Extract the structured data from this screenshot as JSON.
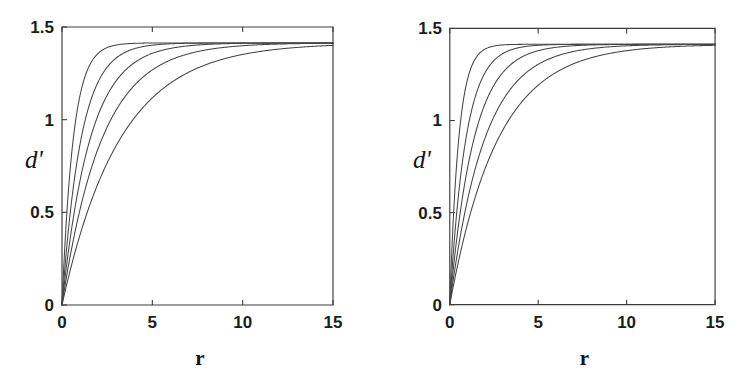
{
  "figure": {
    "background_color": "#ffffff",
    "ink_color": "#3c3c3c",
    "curve_color": "#454545",
    "panel_count": 2
  },
  "chart_data": [
    {
      "type": "line",
      "panel": "left",
      "title": "",
      "xlabel": "r",
      "ylabel": "d'",
      "xlim": [
        0,
        15
      ],
      "ylim": [
        0,
        1.5
      ],
      "xticks": [
        0,
        5,
        10,
        15
      ],
      "xticklabels": [
        "0",
        "5",
        "10",
        "15"
      ],
      "yticks": [
        0,
        0.5,
        1,
        1.5
      ],
      "yticklabels": [
        "0",
        "0.5",
        "1",
        "1.5"
      ],
      "grid": false,
      "legend": "none",
      "asymptote": 1.414,
      "series": [
        {
          "name": "curve-1",
          "tau": 0.62,
          "x": [
            0,
            0.15,
            0.3,
            0.5,
            0.75,
            1,
            1.25,
            1.5,
            1.75,
            2,
            2.5,
            3,
            3.5,
            4,
            5,
            6,
            7,
            8,
            9,
            10,
            11,
            12,
            13,
            14,
            15
          ],
          "y": [
            0,
            0.299,
            0.538,
            0.797,
            1.012,
            1.159,
            1.259,
            1.327,
            1.373,
            1.404,
            1.411,
            1.4135,
            1.4139,
            1.414,
            1.414,
            1.414,
            1.414,
            1.414,
            1.414,
            1.414,
            1.414,
            1.414,
            1.414,
            1.414,
            1.414
          ]
        },
        {
          "name": "curve-2",
          "tau": 1.05,
          "x": [
            0,
            0.25,
            0.5,
            0.75,
            1,
            1.5,
            2,
            2.5,
            3,
            3.5,
            4,
            4.5,
            5,
            6,
            7,
            8,
            9,
            10,
            11,
            12,
            13,
            14,
            15
          ],
          "y": [
            0,
            0.3,
            0.544,
            0.742,
            0.904,
            1.145,
            1.3,
            1.4,
            1.414,
            1.414,
            1.414,
            1.414,
            1.414,
            1.414,
            1.414,
            1.414,
            1.414,
            1.414,
            1.414,
            1.414,
            1.414,
            1.414,
            1.414
          ]
        },
        {
          "name": "curve-3",
          "tau": 1.55,
          "x": [
            0,
            0.25,
            0.5,
            1,
            1.5,
            2,
            2.5,
            3,
            3.5,
            4,
            4.5,
            5,
            5.5,
            6,
            7,
            8,
            9,
            10,
            11,
            12,
            13,
            14,
            15
          ],
          "y": [
            0,
            0.213,
            0.4,
            0.718,
            0.963,
            1.151,
            1.295,
            1.4,
            1.414,
            1.414,
            1.414,
            1.414,
            1.414,
            1.414,
            1.414,
            1.414,
            1.414,
            1.414,
            1.414,
            1.414,
            1.414,
            1.414,
            1.414
          ]
        },
        {
          "name": "curve-4",
          "tau": 2.2,
          "x": [
            0,
            0.5,
            1,
            1.5,
            2,
            2.5,
            3,
            3.5,
            4,
            4.5,
            5,
            5.5,
            6,
            6.5,
            7,
            8,
            9,
            10,
            11,
            12,
            13,
            14,
            15
          ],
          "y": [
            0,
            0.299,
            0.551,
            0.764,
            0.942,
            1.094,
            1.22,
            1.326,
            1.41,
            1.414,
            1.414,
            1.414,
            1.414,
            1.414,
            1.414,
            1.414,
            1.414,
            1.414,
            1.414,
            1.414,
            1.414,
            1.414,
            1.414
          ]
        },
        {
          "name": "curve-5",
          "tau": 3.2,
          "x": [
            0,
            0.5,
            1,
            1.5,
            2,
            2.5,
            3,
            3.5,
            4,
            5,
            6,
            7,
            8,
            9,
            10,
            11,
            12,
            13,
            14,
            15
          ],
          "y": [
            0,
            0.212,
            0.4,
            0.566,
            0.714,
            0.845,
            0.962,
            1.065,
            1.157,
            1.308,
            1.414,
            1.414,
            1.414,
            1.414,
            1.414,
            1.414,
            1.414,
            1.414,
            1.414,
            1.414
          ]
        }
      ]
    },
    {
      "type": "line",
      "panel": "right",
      "title": "",
      "xlabel": "r",
      "ylabel": "d'",
      "xlim": [
        0,
        15
      ],
      "ylim": [
        0,
        1.5
      ],
      "xticks": [
        0,
        5,
        10,
        15
      ],
      "xticklabels": [
        "0",
        "5",
        "10",
        "15"
      ],
      "yticks": [
        0,
        0.5,
        1,
        1.5
      ],
      "yticklabels": [
        "0",
        "0.5",
        "1",
        "1.5"
      ],
      "grid": false,
      "legend": "none",
      "asymptote": 1.414,
      "series": [
        {
          "name": "curve-1",
          "tau": 0.5,
          "x": [
            0,
            0.15,
            0.3,
            0.5,
            0.7,
            0.9,
            1.1,
            1.3,
            1.5,
            1.8,
            2,
            2.5,
            3,
            4,
            5,
            6,
            7,
            8,
            9,
            10,
            11,
            12,
            13,
            14,
            15
          ],
          "y": [
            0,
            0.361,
            0.638,
            0.924,
            1.106,
            1.228,
            1.311,
            1.365,
            1.4,
            1.412,
            1.414,
            1.414,
            1.414,
            1.414,
            1.414,
            1.414,
            1.414,
            1.414,
            1.414,
            1.414,
            1.414,
            1.414,
            1.414,
            1.414,
            1.414
          ]
        },
        {
          "name": "curve-2",
          "tau": 0.9,
          "x": [
            0,
            0.25,
            0.5,
            0.75,
            1,
            1.5,
            2,
            2.5,
            3,
            3.5,
            4,
            5,
            6,
            7,
            8,
            9,
            10,
            11,
            12,
            13,
            14,
            15
          ],
          "y": [
            0,
            0.343,
            0.607,
            0.81,
            0.966,
            1.177,
            1.3,
            1.4,
            1.414,
            1.414,
            1.414,
            1.414,
            1.414,
            1.414,
            1.414,
            1.414,
            1.414,
            1.414,
            1.414,
            1.414,
            1.414,
            1.414
          ]
        },
        {
          "name": "curve-3",
          "tau": 1.35,
          "x": [
            0,
            0.25,
            0.5,
            1,
            1.5,
            2,
            2.5,
            3,
            3.5,
            4,
            4.5,
            5,
            6,
            7,
            8,
            9,
            10,
            11,
            12,
            13,
            14,
            15
          ],
          "y": [
            0,
            0.24,
            0.447,
            0.79,
            1.043,
            1.228,
            1.364,
            1.41,
            1.414,
            1.414,
            1.414,
            1.414,
            1.414,
            1.414,
            1.414,
            1.414,
            1.414,
            1.414,
            1.414,
            1.414,
            1.414,
            1.414
          ]
        },
        {
          "name": "curve-4",
          "tau": 1.95,
          "x": [
            0,
            0.5,
            1,
            1.5,
            2,
            2.5,
            3,
            3.5,
            4,
            4.5,
            5,
            5.5,
            6,
            7,
            8,
            9,
            10,
            11,
            12,
            13,
            14,
            15
          ],
          "y": [
            0,
            0.331,
            0.604,
            0.826,
            1.008,
            1.157,
            1.278,
            1.375,
            1.412,
            1.414,
            1.414,
            1.414,
            1.414,
            1.414,
            1.414,
            1.414,
            1.414,
            1.414,
            1.414,
            1.414,
            1.414,
            1.414
          ]
        },
        {
          "name": "curve-5",
          "tau": 2.7,
          "x": [
            0,
            0.5,
            1,
            1.5,
            2,
            2.5,
            3,
            3.5,
            4,
            4.5,
            5,
            6,
            7,
            8,
            9,
            10,
            11,
            12,
            13,
            14,
            15
          ],
          "y": [
            0,
            0.248,
            0.466,
            0.653,
            0.817,
            0.958,
            1.08,
            1.185,
            1.276,
            1.35,
            1.405,
            1.414,
            1.414,
            1.414,
            1.414,
            1.414,
            1.414,
            1.414,
            1.414,
            1.414,
            1.414
          ]
        }
      ]
    }
  ]
}
